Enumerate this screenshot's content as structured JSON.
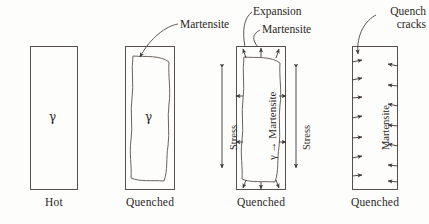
{
  "figure": {
    "type": "diagram",
    "panel_count": 4
  },
  "panels": [
    {
      "id": "panel-hot",
      "caption": "Hot",
      "interior_label": "γ",
      "has_martensite_shell": false,
      "has_cracks": false,
      "callouts": []
    },
    {
      "id": "panel-quenched-shell",
      "caption": "Quenched",
      "interior_label": "γ",
      "has_martensite_shell": true,
      "has_cracks": false,
      "callouts": [
        "Martensite"
      ]
    },
    {
      "id": "panel-quenched-expansion",
      "caption": "Quenched",
      "interior_label": "γ → Martensite",
      "has_martensite_shell": true,
      "has_cracks": false,
      "callouts": [
        "Expansion",
        "Martensite"
      ],
      "stress_label_left": "Stress",
      "stress_label_right": "Stress"
    },
    {
      "id": "panel-quenched-cracks",
      "caption": "Quenched",
      "interior_label": "Martensite",
      "has_martensite_shell": false,
      "has_cracks": true,
      "callouts": [
        "Quench cracks"
      ],
      "crack_count_per_side": 7
    }
  ],
  "callouts": {
    "martensite_p2": "Martensite",
    "expansion_p3": "Expansion",
    "martensite_p3": "Martensite",
    "quench_cracks_line1": "Quench",
    "quench_cracks_line2": "cracks"
  },
  "colors": {
    "background": "#fdfdfc",
    "outline": "#55504b",
    "text": "#2b2724",
    "wavy": "#6a645e"
  }
}
